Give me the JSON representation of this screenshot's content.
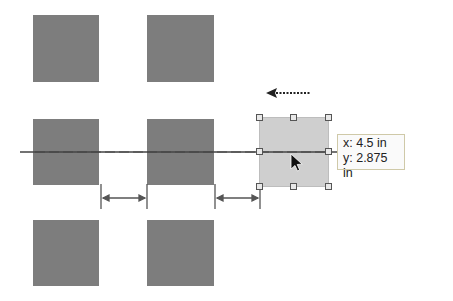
{
  "diagram": {
    "colors": {
      "shape_fill": "#7d7d7d",
      "selected_fill": "#cfcfcf",
      "guide_line": "#444444",
      "handle_border": "#555555"
    },
    "shapes": [
      {
        "id": "r1c1"
      },
      {
        "id": "r1c2"
      },
      {
        "id": "r2c1"
      },
      {
        "id": "r2c2"
      },
      {
        "id": "r3c1"
      },
      {
        "id": "r3c2"
      }
    ],
    "selected_shape": {
      "handles": 8,
      "drag_direction": "left"
    },
    "tooltip": {
      "x_label": "x: 4.5 in",
      "y_label": "y: 2.875 in"
    },
    "spacing_indicators": 2
  }
}
